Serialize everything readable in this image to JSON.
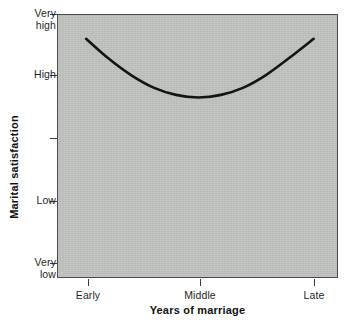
{
  "chart_data": {
    "type": "line",
    "title": "",
    "subtitle": "",
    "xlabel": "Years of marriage",
    "ylabel": "Marital satisfaction",
    "x_categories": [
      "Early",
      "Middle",
      "Late"
    ],
    "x_tick_positions": [
      0,
      0.5,
      1
    ],
    "y_tick_labels": [
      "Very\nhigh",
      "High",
      "",
      "Low",
      "Very\nlow"
    ],
    "y_tick_values": [
      5,
      4,
      3,
      2,
      1
    ],
    "ylim": [
      1,
      5
    ],
    "xlim": [
      0,
      1
    ],
    "grid": false,
    "legend": null,
    "plot_background": "#c1c3c1",
    "line_color": "#141414",
    "line_width": 2.6,
    "annotation": "U-shaped curve: marital satisfaction is high early, declines to a minimum in middle years, and rises again in late years",
    "series": [
      {
        "name": "Marital satisfaction",
        "x": [
          0.1,
          0.18,
          0.26,
          0.34,
          0.42,
          0.5,
          0.58,
          0.66,
          0.74,
          0.82,
          0.91
        ],
        "y": [
          4.64,
          4.34,
          4.09,
          3.9,
          3.79,
          3.75,
          3.79,
          3.9,
          4.09,
          4.34,
          4.64
        ],
        "y_labels_approx": [
          "just below Very high",
          "between High and Very high",
          "just above High",
          "slightly below High",
          "below High",
          "minimum, below High",
          "below High",
          "slightly below High",
          "just above High",
          "between High and Very high",
          "just below Very high"
        ]
      }
    ]
  },
  "axes": {
    "y": {
      "title": "Marital satisfaction",
      "ticks": [
        {
          "label": "Very\nhigh",
          "top": 14
        },
        {
          "label": "High",
          "top": 75
        },
        {
          "label": "",
          "top": 138
        },
        {
          "label": "Low",
          "top": 201
        },
        {
          "label": "Very\nlow",
          "top": 263
        }
      ]
    },
    "x": {
      "title": "Years of marriage",
      "ticks": [
        {
          "label": "Early",
          "left": 88
        },
        {
          "label": "Middle",
          "left": 200
        },
        {
          "label": "Late",
          "left": 314
        }
      ]
    }
  }
}
